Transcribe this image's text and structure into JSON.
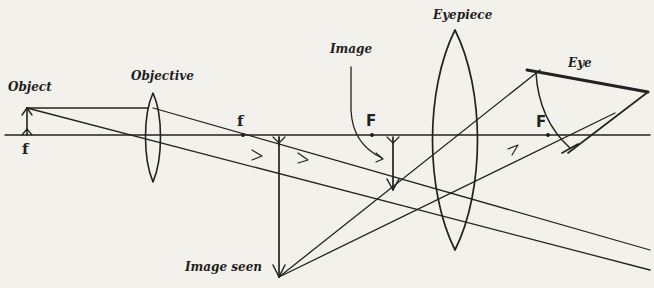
{
  "figure": {
    "labels": {
      "object": "Object",
      "objective": "Objective",
      "image": "Image",
      "eyepiece": "Eyepiece",
      "eye": "Eye",
      "image_seen": "Image seen",
      "focal_objective_left": "f",
      "focal_objective_right": "f",
      "focal_eyepiece_left": "F",
      "focal_eyepiece_right": "F"
    },
    "colors": {
      "ink": "#222222",
      "paper": "#f2f1ec"
    }
  }
}
